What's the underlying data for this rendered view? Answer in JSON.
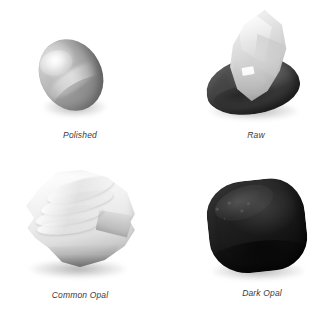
{
  "figure": {
    "background_color": "#ffffff",
    "caption_color": "#3b3b3b",
    "layout": "2x2-grid",
    "width": 330,
    "height": 309
  },
  "specimens": [
    {
      "id": "polished",
      "caption": "Polished",
      "form": "oval cabochon",
      "appearance": "smooth polished grey oval with soft highlight band",
      "tone": "mid-grey"
    },
    {
      "id": "raw",
      "caption": "Raw",
      "form": "rough crystal on dark matrix",
      "appearance": "pale translucent angular crystal resting on a dark rounded base",
      "tone": "light grey over near-black"
    },
    {
      "id": "common-opal",
      "caption": "Common Opal",
      "form": "rough nodule",
      "appearance": "white ridged fractured mass with dark grey lower edge",
      "tone": "white"
    },
    {
      "id": "dark-opal",
      "caption": "Dark Opal",
      "form": "tumbled nodule",
      "appearance": "rounded near-black stone with faint surface sheen",
      "tone": "black"
    }
  ]
}
